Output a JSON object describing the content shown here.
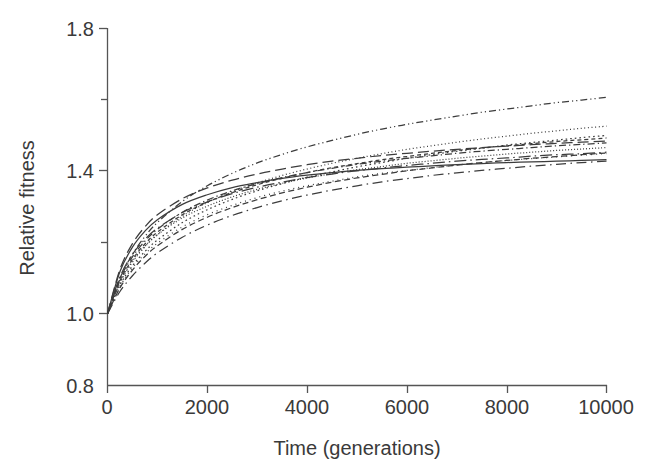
{
  "chart_data": {
    "type": "line",
    "title": "",
    "xlabel": "Time (generations)",
    "ylabel": "Relative fitness",
    "xlim": [
      0,
      10000
    ],
    "ylim": [
      0.8,
      1.8
    ],
    "grid": false,
    "legend": "none",
    "x_ticks": [
      0,
      2000,
      4000,
      6000,
      8000,
      10000
    ],
    "x_tick_labels": [
      "0",
      "2000",
      "4000",
      "6000",
      "8000",
      "10000"
    ],
    "y_ticks": [
      0.8,
      1.0,
      1.2,
      1.4,
      1.6,
      1.8
    ],
    "y_tick_labels": [
      "0.8",
      "1.0",
      "",
      "1.4",
      "",
      "1.8"
    ],
    "y_major_labeled": [
      "0.8",
      "1.0",
      "1.4",
      "1.8"
    ],
    "x": [
      0,
      250,
      500,
      750,
      1000,
      1500,
      2000,
      2500,
      3000,
      3500,
      4000,
      4500,
      5000,
      5500,
      6000,
      6500,
      7000,
      7500,
      8000,
      8500,
      9000,
      9500,
      10000
    ],
    "series": [
      {
        "name": "population-1",
        "dash": "dotted-fine",
        "values": [
          1.0,
          1.086,
          1.144,
          1.187,
          1.221,
          1.273,
          1.311,
          1.341,
          1.366,
          1.387,
          1.405,
          1.421,
          1.435,
          1.448,
          1.46,
          1.47,
          1.48,
          1.489,
          1.497,
          1.505,
          1.512,
          1.519,
          1.525
        ]
      },
      {
        "name": "population-2",
        "dash": "dash-dot-dot",
        "values": [
          1.0,
          1.099,
          1.166,
          1.216,
          1.255,
          1.314,
          1.358,
          1.393,
          1.422,
          1.446,
          1.467,
          1.485,
          1.502,
          1.517,
          1.53,
          1.542,
          1.553,
          1.564,
          1.573,
          1.582,
          1.591,
          1.598,
          1.606
        ]
      },
      {
        "name": "population-3",
        "dash": "dotted-coarse",
        "values": [
          1.0,
          1.08,
          1.134,
          1.174,
          1.206,
          1.255,
          1.291,
          1.32,
          1.344,
          1.364,
          1.382,
          1.397,
          1.411,
          1.423,
          1.435,
          1.445,
          1.455,
          1.463,
          1.472,
          1.479,
          1.486,
          1.493,
          1.499
        ]
      },
      {
        "name": "population-4",
        "dash": "dashed-short",
        "values": [
          1.0,
          1.092,
          1.152,
          1.195,
          1.228,
          1.277,
          1.312,
          1.339,
          1.361,
          1.379,
          1.395,
          1.409,
          1.42,
          1.431,
          1.44,
          1.449,
          1.457,
          1.464,
          1.47,
          1.476,
          1.482,
          1.487,
          1.492
        ]
      },
      {
        "name": "population-5",
        "dash": "dash-dot",
        "values": [
          1.0,
          1.097,
          1.159,
          1.203,
          1.236,
          1.284,
          1.318,
          1.344,
          1.364,
          1.381,
          1.395,
          1.407,
          1.418,
          1.427,
          1.435,
          1.442,
          1.449,
          1.455,
          1.46,
          1.465,
          1.47,
          1.474,
          1.478
        ]
      },
      {
        "name": "population-6",
        "dash": "dashed-long",
        "values": [
          1.0,
          1.124,
          1.196,
          1.243,
          1.277,
          1.322,
          1.352,
          1.374,
          1.391,
          1.405,
          1.417,
          1.427,
          1.435,
          1.443,
          1.449,
          1.455,
          1.46,
          1.465,
          1.469,
          1.473,
          1.477,
          1.48,
          1.483
        ]
      },
      {
        "name": "population-7",
        "dash": "dash-dot-long",
        "values": [
          1.0,
          1.103,
          1.166,
          1.208,
          1.239,
          1.283,
          1.313,
          1.336,
          1.354,
          1.368,
          1.381,
          1.391,
          1.4,
          1.408,
          1.415,
          1.421,
          1.427,
          1.432,
          1.436,
          1.441,
          1.445,
          1.448,
          1.452
        ]
      },
      {
        "name": "population-8",
        "dash": "solid",
        "values": [
          1.0,
          1.118,
          1.186,
          1.231,
          1.263,
          1.306,
          1.333,
          1.353,
          1.367,
          1.379,
          1.388,
          1.395,
          1.401,
          1.406,
          1.41,
          1.414,
          1.417,
          1.42,
          1.423,
          1.425,
          1.427,
          1.429,
          1.431
        ]
      },
      {
        "name": "population-9",
        "dash": "dotted-sparse",
        "values": [
          1.0,
          1.076,
          1.128,
          1.167,
          1.197,
          1.243,
          1.277,
          1.303,
          1.325,
          1.343,
          1.358,
          1.371,
          1.383,
          1.393,
          1.401,
          1.409,
          1.416,
          1.423,
          1.429,
          1.434,
          1.439,
          1.444,
          1.448
        ]
      },
      {
        "name": "population-10",
        "dash": "dashed-medium",
        "values": [
          1.0,
          1.072,
          1.122,
          1.16,
          1.19,
          1.236,
          1.27,
          1.297,
          1.319,
          1.338,
          1.354,
          1.368,
          1.38,
          1.39,
          1.4,
          1.408,
          1.416,
          1.423,
          1.429,
          1.435,
          1.44,
          1.445,
          1.45
        ]
      },
      {
        "name": "population-11",
        "dash": "dash-dot-sparse",
        "values": [
          1.0,
          1.062,
          1.106,
          1.141,
          1.17,
          1.214,
          1.248,
          1.275,
          1.297,
          1.316,
          1.332,
          1.346,
          1.358,
          1.369,
          1.378,
          1.387,
          1.394,
          1.401,
          1.407,
          1.413,
          1.418,
          1.423,
          1.427
        ]
      },
      {
        "name": "population-12",
        "dash": "dotted-dense",
        "values": [
          1.0,
          1.088,
          1.147,
          1.189,
          1.221,
          1.268,
          1.301,
          1.327,
          1.348,
          1.365,
          1.38,
          1.392,
          1.403,
          1.412,
          1.421,
          1.428,
          1.435,
          1.441,
          1.447,
          1.452,
          1.457,
          1.461,
          1.465
        ]
      }
    ]
  },
  "axes": {
    "x_label": "Time (generations)",
    "y_label": "Relative fitness",
    "y_tick_0": "1.8",
    "y_tick_1": "1.4",
    "y_tick_2": "1.0",
    "y_tick_3": "0.8",
    "x_tick_0": "0",
    "x_tick_1": "2000",
    "x_tick_2": "4000",
    "x_tick_3": "6000",
    "x_tick_4": "8000",
    "x_tick_5": "10000"
  },
  "colors": {
    "curve": "#3c3c3c",
    "axis": "#555555",
    "text": "#3a3a3a",
    "background": "#ffffff"
  }
}
